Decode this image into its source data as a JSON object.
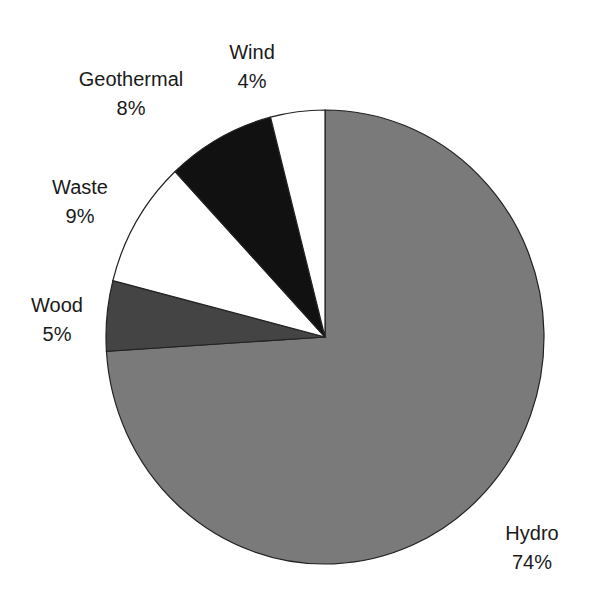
{
  "chart_data": {
    "type": "pie",
    "title": "",
    "start_angle_deg": 0,
    "direction": "clockwise-from-top",
    "slices": [
      {
        "label": "Hydro",
        "pct_label": "74%",
        "value": 74,
        "color": "#7a7a7a",
        "label_x": 532,
        "label_y": 540
      },
      {
        "label": "Wood",
        "pct_label": "5%",
        "value": 5,
        "color": "#444444",
        "label_x": 57,
        "label_y": 312
      },
      {
        "label": "Waste",
        "pct_label": "9%",
        "value": 9,
        "color": "#ffffff",
        "label_x": 80,
        "label_y": 194
      },
      {
        "label": "Geothermal",
        "pct_label": "8%",
        "value": 8,
        "color": "#111111",
        "label_x": 131,
        "label_y": 86
      },
      {
        "label": "Wind",
        "pct_label": "4%",
        "value": 4,
        "color": "#ffffff",
        "label_x": 252,
        "label_y": 59
      }
    ],
    "geometry": {
      "cx": 325,
      "cy": 337,
      "rx": 219,
      "ry": 227
    }
  }
}
